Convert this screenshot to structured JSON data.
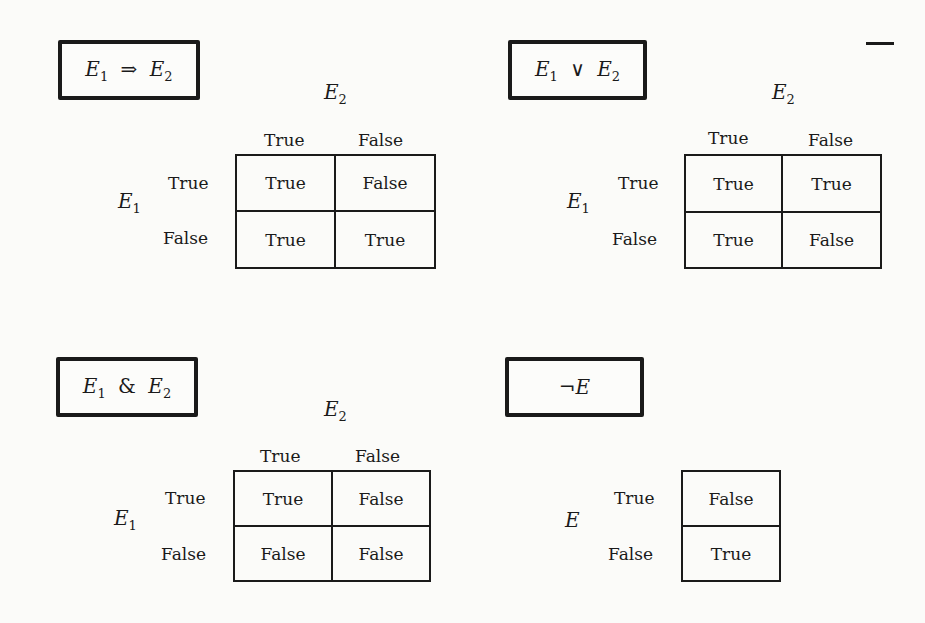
{
  "panels": {
    "implies": {
      "title_lhs": "E",
      "title_lhs_sub": "1",
      "title_op": "⇒",
      "title_rhs": "E",
      "title_rhs_sub": "2",
      "col_var": "E",
      "col_var_sub": "2",
      "row_var": "E",
      "row_var_sub": "1",
      "col_headers": [
        "True",
        "False"
      ],
      "row_headers": [
        "True",
        "False"
      ],
      "cells": [
        [
          "True",
          "False"
        ],
        [
          "True",
          "True"
        ]
      ]
    },
    "or": {
      "title_lhs": "E",
      "title_lhs_sub": "1",
      "title_op": "∨",
      "title_rhs": "E",
      "title_rhs_sub": "2",
      "col_var": "E",
      "col_var_sub": "2",
      "row_var": "E",
      "row_var_sub": "1",
      "col_headers": [
        "True",
        "False"
      ],
      "row_headers": [
        "True",
        "False"
      ],
      "cells": [
        [
          "True",
          "True"
        ],
        [
          "True",
          "False"
        ]
      ]
    },
    "and": {
      "title_lhs": "E",
      "title_lhs_sub": "1",
      "title_op": "&",
      "title_rhs": "E",
      "title_rhs_sub": "2",
      "col_var": "E",
      "col_var_sub": "2",
      "row_var": "E",
      "row_var_sub": "1",
      "col_headers": [
        "True",
        "False"
      ],
      "row_headers": [
        "True",
        "False"
      ],
      "cells": [
        [
          "True",
          "False"
        ],
        [
          "False",
          "False"
        ]
      ]
    },
    "not": {
      "title_op": "¬",
      "title_rhs": "E",
      "row_var": "E",
      "row_headers": [
        "True",
        "False"
      ],
      "cells": [
        "False",
        "True"
      ]
    }
  }
}
